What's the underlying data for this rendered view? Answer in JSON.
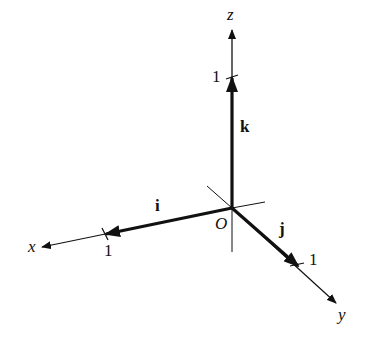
{
  "diagram": {
    "origin_label": "O",
    "axes": {
      "x": {
        "label": "x",
        "unit_tick_label": "1"
      },
      "y": {
        "label": "y",
        "unit_tick_label": "1"
      },
      "z": {
        "label": "z",
        "unit_tick_label": "1"
      }
    },
    "vectors": [
      {
        "name": "i",
        "label": "i",
        "direction": "x"
      },
      {
        "name": "j",
        "label": "j",
        "direction": "y"
      },
      {
        "name": "k",
        "label": "k",
        "direction": "z"
      }
    ],
    "colors": {
      "ink": "#111111",
      "background": "#ffffff"
    }
  }
}
